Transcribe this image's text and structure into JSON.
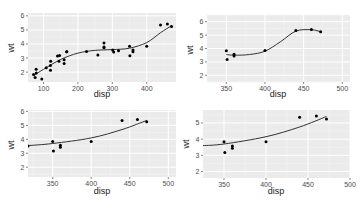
{
  "chart_data": [
    {
      "type": "scatter",
      "panel": "top-left",
      "xlabel": "disp",
      "ylabel": "wt",
      "xlim": [
        55,
        485
      ],
      "ylim": [
        1.3,
        6.2
      ],
      "x_ticks": [
        100,
        200,
        300,
        400
      ],
      "y_ticks": [
        2,
        3,
        4,
        5,
        6
      ],
      "grid": true,
      "smooth": "loess",
      "points": [
        [
          71.1,
          1.835
        ],
        [
          75.7,
          1.615
        ],
        [
          78.7,
          2.2
        ],
        [
          79,
          1.935
        ],
        [
          95.1,
          1.513
        ],
        [
          108,
          2.32
        ],
        [
          120.1,
          2.465
        ],
        [
          120.3,
          2.14
        ],
        [
          121,
          2.78
        ],
        [
          140.8,
          3.15
        ],
        [
          145,
          2.77
        ],
        [
          146.7,
          3.19
        ],
        [
          160,
          2.62
        ],
        [
          160,
          2.875
        ],
        [
          167.6,
          3.44
        ],
        [
          167.6,
          3.44
        ],
        [
          225,
          3.46
        ],
        [
          258,
          3.215
        ],
        [
          275.8,
          4.07
        ],
        [
          275.8,
          3.73
        ],
        [
          275.8,
          3.78
        ],
        [
          301,
          3.57
        ],
        [
          304,
          3.435
        ],
        [
          318,
          3.52
        ],
        [
          350,
          3.84
        ],
        [
          351,
          3.17
        ],
        [
          360,
          3.44
        ],
        [
          360,
          3.57
        ],
        [
          400,
          3.845
        ],
        [
          440,
          5.345
        ],
        [
          460,
          5.424
        ],
        [
          472,
          5.25
        ]
      ],
      "smooth_curve": [
        [
          71,
          1.75
        ],
        [
          100,
          2.2
        ],
        [
          150,
          2.9
        ],
        [
          200,
          3.35
        ],
        [
          250,
          3.55
        ],
        [
          300,
          3.6
        ],
        [
          350,
          3.7
        ],
        [
          400,
          4.1
        ],
        [
          440,
          4.8
        ],
        [
          472,
          5.3
        ]
      ]
    },
    {
      "type": "scatter",
      "panel": "top-right",
      "xlabel": "disp",
      "ylabel": "wt",
      "xlim": [
        325,
        510
      ],
      "ylim": [
        1.5,
        6.5
      ],
      "x_ticks": [
        350,
        400,
        450,
        500
      ],
      "y_ticks": [
        2,
        3,
        4,
        5,
        6
      ],
      "grid": true,
      "smooth": "loess",
      "points": [
        [
          350,
          3.84
        ],
        [
          351,
          3.17
        ],
        [
          360,
          3.44
        ],
        [
          360,
          3.57
        ],
        [
          400,
          3.845
        ],
        [
          440,
          5.345
        ],
        [
          460,
          5.424
        ],
        [
          472,
          5.25
        ]
      ],
      "smooth_curve": [
        [
          350,
          3.55
        ],
        [
          360,
          3.5
        ],
        [
          380,
          3.55
        ],
        [
          400,
          3.8
        ],
        [
          420,
          4.5
        ],
        [
          440,
          5.3
        ],
        [
          460,
          5.4
        ],
        [
          472,
          5.25
        ]
      ]
    },
    {
      "type": "scatter",
      "panel": "bottom-left",
      "xlabel": "disp",
      "ylabel": "wt",
      "xlim": [
        318,
        510
      ],
      "ylim": [
        1.3,
        6.1
      ],
      "x_ticks": [
        350,
        400,
        450,
        500
      ],
      "y_ticks": [
        2,
        3,
        4,
        5,
        6
      ],
      "grid": true,
      "smooth": "lm-quadratic",
      "points": [
        [
          318,
          3.52
        ],
        [
          350,
          3.84
        ],
        [
          351,
          3.17
        ],
        [
          360,
          3.44
        ],
        [
          360,
          3.57
        ],
        [
          400,
          3.845
        ],
        [
          440,
          5.345
        ],
        [
          460,
          5.424
        ],
        [
          472,
          5.25
        ]
      ],
      "smooth_curve": [
        [
          318,
          3.55
        ],
        [
          350,
          3.7
        ],
        [
          400,
          4.1
        ],
        [
          440,
          4.7
        ],
        [
          472,
          5.35
        ]
      ]
    },
    {
      "type": "scatter",
      "panel": "bottom-right",
      "xlabel": "disp",
      "ylabel": "wt",
      "xlim": [
        325,
        500
      ],
      "ylim": [
        1.6,
        5.8
      ],
      "x_ticks": [
        350,
        400,
        450,
        500
      ],
      "y_ticks": [
        2,
        3,
        4,
        5
      ],
      "grid": true,
      "smooth": "lm-quadratic",
      "points": [
        [
          350,
          3.84
        ],
        [
          351,
          3.17
        ],
        [
          360,
          3.44
        ],
        [
          360,
          3.57
        ],
        [
          400,
          3.845
        ],
        [
          440,
          5.345
        ],
        [
          460,
          5.424
        ],
        [
          472,
          5.25
        ]
      ],
      "smooth_curve": [
        [
          325,
          3.6
        ],
        [
          350,
          3.7
        ],
        [
          400,
          4.15
        ],
        [
          440,
          4.75
        ],
        [
          472,
          5.4
        ]
      ]
    }
  ],
  "panels": [
    {
      "box": [
        28,
        13,
        176,
        82
      ],
      "xlabel_pos": [
        102,
        97
      ],
      "ylabel_pos": [
        14,
        48
      ]
    },
    {
      "box": [
        207,
        15,
        350,
        82
      ],
      "xlabel_pos": [
        278,
        97
      ],
      "ylabel_pos": [
        193,
        50
      ]
    },
    {
      "box": [
        28,
        110,
        176,
        177
      ],
      "xlabel_pos": [
        102,
        194
      ],
      "ylabel_pos": [
        14,
        145
      ]
    },
    {
      "box": [
        203,
        110,
        350,
        178
      ],
      "xlabel_pos": [
        276,
        194
      ],
      "ylabel_pos": [
        189,
        144
      ]
    }
  ],
  "colors": {
    "panel_bg": "#ebebeb",
    "grid_major": "#ffffff",
    "grid_minor": "#f5f5f5",
    "point": "#000000",
    "smooth_line": "#333333"
  }
}
